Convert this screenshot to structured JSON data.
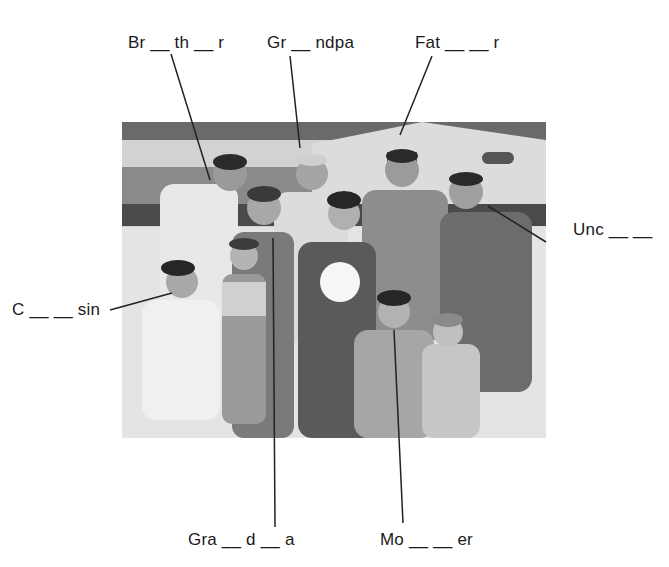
{
  "worksheet": {
    "title": "Family members labeling exercise",
    "labels": [
      {
        "id": "brother",
        "text": "Br __ th __ r"
      },
      {
        "id": "grandpa",
        "text": "Gr __ ndpa"
      },
      {
        "id": "father",
        "text": "Fat __ __ r"
      },
      {
        "id": "uncle",
        "text": "Unc __ __"
      },
      {
        "id": "cousin",
        "text": "C __ __ sin"
      },
      {
        "id": "grandma",
        "text": "Gra __ d __ a"
      },
      {
        "id": "mother",
        "text": "Mo __ __ er"
      }
    ],
    "photo": {
      "description": "Black-and-white photo of a smiling extended family of eleven posing on a sandy beach in front of a building; a young woman in the center holds a white volleyball",
      "colors": {
        "sky": "#6e6e6e",
        "building": "#d6d6d6",
        "sand": "#e2e2e2"
      }
    },
    "line_color": "#222222"
  }
}
